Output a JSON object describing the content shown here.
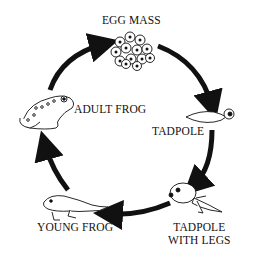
{
  "stages": [
    {
      "label": "EGG MASS"
    },
    {
      "label": "TADPOLE"
    },
    {
      "label": "TADPOLE",
      "label2": "WITH LEGS"
    },
    {
      "label": "YOUNG FROG"
    },
    {
      "label": "ADULT FROG"
    }
  ],
  "colors": {
    "arrow": "#111111",
    "background": "#ffffff"
  }
}
